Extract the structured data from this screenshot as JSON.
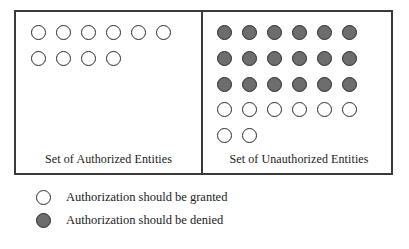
{
  "colors": {
    "background": "#ffffff",
    "frame_border": "#3a3a3a",
    "dot_outline": "#2b2b2b",
    "granted_fill": "#ffffff",
    "denied_fill": "#6d6d6d",
    "text": "#1a1a1a"
  },
  "diagram": {
    "panels": [
      {
        "id": "authorized",
        "caption": "Set of Authorized Entities",
        "rows": [
          {
            "count": 6,
            "state": "granted"
          },
          {
            "count": 4,
            "state": "granted"
          }
        ]
      },
      {
        "id": "unauthorized",
        "caption": "Set of Unauthorized Entities",
        "rows": [
          {
            "count": 6,
            "state": "denied"
          },
          {
            "count": 6,
            "state": "denied"
          },
          {
            "count": 6,
            "state": "denied"
          },
          {
            "count": 6,
            "state": "granted"
          },
          {
            "count": 2,
            "state": "granted"
          }
        ]
      }
    ]
  },
  "legend": {
    "items": [
      {
        "state": "granted",
        "label": "Authorization should be granted"
      },
      {
        "state": "denied",
        "label": "Authorization should be denied"
      }
    ]
  }
}
